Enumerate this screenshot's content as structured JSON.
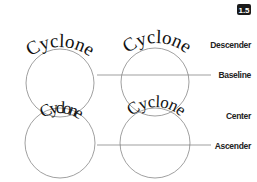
{
  "badge": {
    "text": "1.5"
  },
  "word": "Cyclone",
  "examples": [
    {
      "id": "descender",
      "label": "Descender",
      "text": "Cyclone",
      "position": "top-left"
    },
    {
      "id": "baseline",
      "label": "Baseline",
      "text": "Cyclone",
      "position": "top-right"
    },
    {
      "id": "center",
      "label": "Center",
      "text": "Cyclone",
      "position": "bottom-left"
    },
    {
      "id": "ascender",
      "label": "Ascender",
      "text": "Cyclone",
      "position": "bottom-right"
    }
  ],
  "labels": {
    "descender": "Descender",
    "baseline": "Baseline",
    "center": "Center",
    "ascender": "Ascender"
  },
  "colors": {
    "stroke": "#888888",
    "text": "#111111",
    "badge_bg": "#1a1a1a"
  }
}
